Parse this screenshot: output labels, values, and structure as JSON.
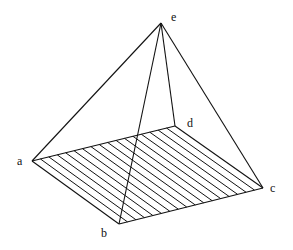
{
  "diagram": {
    "colors": {
      "background": "#ffffff",
      "ink": "#111111"
    },
    "vertices": {
      "e": {
        "x": 161,
        "y": 23
      },
      "a": {
        "x": 32,
        "y": 161
      },
      "b": {
        "x": 119,
        "y": 224
      },
      "c": {
        "x": 263,
        "y": 188
      },
      "d": {
        "x": 175,
        "y": 126
      }
    },
    "labels": {
      "e": {
        "text": "e",
        "x": 171,
        "y": 21
      },
      "a": {
        "text": "a",
        "x": 17,
        "y": 165
      },
      "b": {
        "text": "b",
        "x": 101,
        "y": 237
      },
      "c": {
        "text": "c",
        "x": 270,
        "y": 192
      },
      "d": {
        "text": "d",
        "x": 187,
        "y": 127
      }
    },
    "edges": [
      [
        "a",
        "d"
      ],
      [
        "a",
        "b"
      ],
      [
        "b",
        "c"
      ],
      [
        "d",
        "c"
      ],
      [
        "e",
        "a"
      ],
      [
        "e",
        "b"
      ],
      [
        "e",
        "c"
      ],
      [
        "e",
        "d"
      ]
    ],
    "base_hatch": {
      "from_edge": [
        "a",
        "d"
      ],
      "to_edge": [
        "b",
        "c"
      ],
      "count": 16
    }
  }
}
